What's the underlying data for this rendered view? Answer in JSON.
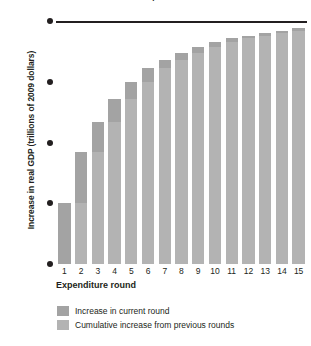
{
  "chart_data": {
    "type": "bar",
    "title": "The Multiplier Effect",
    "xlabel": "Expenditure round",
    "ylabel": "Increase in real GDP (trillions of 2009 dollars)",
    "categories": [
      "1",
      "2",
      "3",
      "4",
      "5",
      "6",
      "7",
      "8",
      "9",
      "10",
      "11",
      "12",
      "13",
      "14",
      "15"
    ],
    "ytick_labels": [
      "0",
      "0.5",
      "1.0",
      "1.5",
      "2.0"
    ],
    "ytick_values": [
      0,
      0.5,
      1.0,
      1.5,
      2.0
    ],
    "ylim": [
      0,
      2.0
    ],
    "grid": false,
    "legend_position": "below-axis-left",
    "reference_line": {
      "value": 2.0,
      "color": "#231f20"
    },
    "series": [
      {
        "name": "Cumulative increase from previous rounds",
        "color": "#b3b3b3",
        "values": [
          0,
          0.5,
          0.92,
          1.17,
          1.36,
          1.5,
          1.61,
          1.68,
          1.74,
          1.79,
          1.83,
          1.86,
          1.88,
          1.9,
          1.92
        ]
      },
      {
        "name": "Increase in current round",
        "color": "#a3a3a3",
        "values": [
          0.5,
          0.42,
          0.25,
          0.19,
          0.14,
          0.11,
          0.07,
          0.06,
          0.05,
          0.04,
          0.03,
          0.02,
          0.02,
          0.02,
          0.02
        ]
      }
    ],
    "totals": [
      0.5,
      0.92,
      1.17,
      1.36,
      1.5,
      1.61,
      1.68,
      1.74,
      1.79,
      1.83,
      1.86,
      1.88,
      1.9,
      1.92,
      1.94
    ]
  },
  "legend": {
    "items": [
      {
        "label": "Increase in current round"
      },
      {
        "label": "Cumulative increase from previous rounds"
      }
    ]
  },
  "colors": {
    "current_round": "#a3a3a3",
    "previous_rounds": "#b3b3b3",
    "axis": "#231f20",
    "background": "#ffffff"
  }
}
